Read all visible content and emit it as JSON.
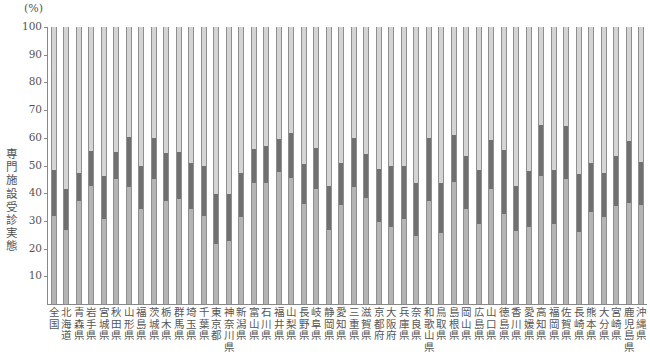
{
  "chart_data": {
    "type": "bar",
    "stacked": true,
    "title": "",
    "unit_label": "(%)",
    "ylabel": "専門施設受診実態",
    "xlabel": "",
    "ylim": [
      0,
      100
    ],
    "yticks": [
      10,
      20,
      30,
      40,
      50,
      60,
      70,
      80,
      90,
      100
    ],
    "grid": false,
    "legend": null,
    "colors": {
      "bottom": "#b4b4b4",
      "middle": "#707070",
      "top": "#d4d4d4",
      "outline": "#8f8f8f"
    },
    "categories": [
      "全国",
      "北海道",
      "青森県",
      "岩手県",
      "宮城県",
      "秋田県",
      "山形県",
      "福島県",
      "茨城県",
      "栃木県",
      "群馬県",
      "埼玉県",
      "千葉県",
      "東京都",
      "神奈川県",
      "新潟県",
      "富山県",
      "石川県",
      "福井県",
      "山梨県",
      "長野県",
      "岐阜県",
      "静岡県",
      "愛知県",
      "三重県",
      "滋賀県",
      "京都府",
      "大阪府",
      "兵庫県",
      "奈良県",
      "和歌山県",
      "鳥取県",
      "島根県",
      "岡山県",
      "広島県",
      "山口県",
      "徳島県",
      "香川県",
      "愛媛県",
      "高知県",
      "福岡県",
      "佐賀県",
      "長崎県",
      "熊本県",
      "大分県",
      "宮崎県",
      "鹿児島県",
      "沖縄県"
    ],
    "series": [
      {
        "name": "bottom segment",
        "values": [
          31.8,
          26.7,
          37.1,
          42.7,
          30.7,
          45.1,
          42.1,
          34.3,
          45.1,
          37.3,
          38.0,
          34.3,
          31.9,
          21.5,
          22.6,
          31.5,
          43.8,
          43.8,
          47.5,
          45.4,
          36.0,
          41.6,
          26.6,
          35.9,
          42.3,
          38.4,
          29.7,
          27.9,
          30.6,
          24.5,
          37.3,
          25.7,
          44.2,
          34.2,
          28.8,
          41.5,
          32.5,
          26.5,
          27.9,
          46.3,
          29.0,
          45.0,
          26.1,
          33.1,
          31.3,
          35.3,
          36.4,
          35.9
        ]
      },
      {
        "name": "middle segment",
        "values": [
          16.6,
          14.8,
          10.3,
          12.5,
          15.6,
          9.8,
          18.1,
          15.5,
          15.0,
          17.2,
          17.0,
          16.6,
          18.0,
          18.1,
          17.1,
          15.9,
          12.2,
          13.2,
          12.2,
          16.3,
          14.4,
          14.7,
          16.1,
          15.1,
          17.6,
          15.8,
          19.0,
          21.8,
          19.3,
          19.3,
          22.7,
          18.0,
          16.9,
          19.2,
          19.6,
          17.7,
          23.0,
          16.1,
          20.0,
          18.4,
          19.3,
          19.3,
          20.8,
          17.8,
          16.0,
          18.1,
          22.3,
          15.4
        ]
      },
      {
        "name": "top segment",
        "values": [
          51.6,
          58.5,
          52.6,
          44.8,
          53.7,
          45.1,
          39.8,
          50.2,
          39.9,
          45.5,
          45.0,
          49.1,
          50.1,
          60.4,
          60.3,
          52.6,
          44.0,
          43.0,
          40.3,
          38.3,
          49.6,
          43.7,
          57.3,
          49.0,
          40.1,
          45.8,
          51.3,
          50.3,
          50.1,
          56.2,
          40.0,
          56.3,
          38.9,
          46.6,
          51.6,
          40.8,
          44.5,
          57.4,
          52.1,
          35.3,
          51.7,
          35.7,
          53.1,
          49.1,
          52.7,
          46.6,
          41.3,
          48.7
        ]
      }
    ],
    "boundaries_upper_pct": [
      48.4,
      41.5,
      47.4,
      55.2,
      46.3,
      54.9,
      60.2,
      49.8,
      60.1,
      54.5,
      55.0,
      50.9,
      49.9,
      39.6,
      39.7,
      47.4,
      56.0,
      57.0,
      59.7,
      61.7,
      50.4,
      56.3,
      42.7,
      51.0,
      59.9,
      54.2,
      48.7,
      49.7,
      49.9,
      43.8,
      60.0,
      43.7,
      61.1,
      53.4,
      48.4,
      59.2,
      55.5,
      42.6,
      47.9,
      64.7,
      48.3,
      64.3,
      46.9,
      50.9,
      47.3,
      53.4,
      58.7,
      51.3
    ]
  },
  "labels": {
    "unit": "(%)",
    "ylabel": "専門施設受診実態",
    "yticks": [
      "10",
      "20",
      "30",
      "40",
      "50",
      "60",
      "70",
      "80",
      "90",
      "100"
    ]
  }
}
